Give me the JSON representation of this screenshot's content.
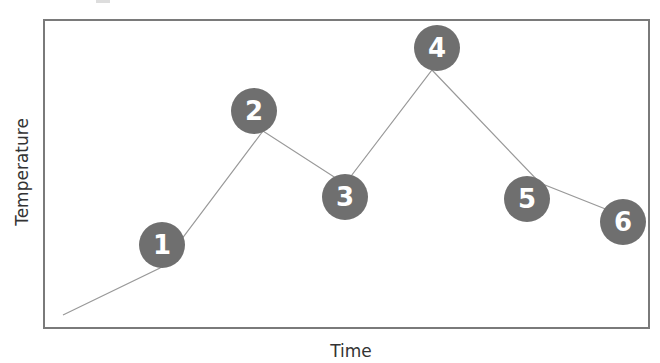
{
  "chart_data": {
    "type": "line",
    "title": "",
    "xlabel": "Time",
    "ylabel": "Temperature",
    "grid": false,
    "legend": null,
    "x_ticks": [],
    "y_ticks": [],
    "line_color": "#999999",
    "marker_color": "#6f6f6f",
    "marker_text_color": "#ffffff",
    "frame_color": "#7a7a7a",
    "start_point": {
      "x": 63,
      "y": 315
    },
    "points": [
      {
        "label": "1",
        "line_x": 160,
        "line_y": 268,
        "marker_x": 162,
        "marker_y": 245
      },
      {
        "label": "2",
        "line_x": 263,
        "line_y": 131,
        "marker_x": 254,
        "marker_y": 111
      },
      {
        "label": "3",
        "line_x": 345,
        "line_y": 184,
        "marker_x": 345,
        "marker_y": 197
      },
      {
        "label": "4",
        "line_x": 432,
        "line_y": 70,
        "marker_x": 437,
        "marker_y": 48
      },
      {
        "label": "5",
        "line_x": 540,
        "line_y": 183,
        "marker_x": 527,
        "marker_y": 199
      },
      {
        "label": "6",
        "line_x": 608,
        "line_y": 210,
        "marker_x": 623,
        "marker_y": 222
      }
    ]
  },
  "axes": {
    "x_label": "Time",
    "y_label": "Temperature"
  },
  "markers": [
    "1",
    "2",
    "3",
    "4",
    "5",
    "6"
  ]
}
